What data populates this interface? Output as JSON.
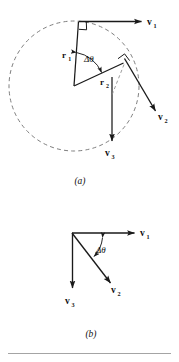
{
  "figure": {
    "background_color": "#ffffff",
    "ink_color": "#1a1a1a",
    "dash_color": "#6f6f6f",
    "panels": [
      {
        "id": "a",
        "caption": "(a)",
        "description": "Particle moving on a dashed circular path; position vectors r1 and r2 separated by angle delta-theta, with tangential velocity vectors v1 and v2, and the change vector v3.",
        "labels": {
          "r1": "r",
          "r1_sub": "1",
          "r2": "r",
          "r2_sub": "2",
          "v1": "v",
          "v1_sub": "1",
          "v2": "v",
          "v2_sub": "2",
          "v3": "v",
          "v3_sub": "3",
          "angle": "Δθ"
        },
        "elements": [
          "dashed-circle",
          "radius-r1",
          "radius-r2",
          "angle-arc",
          "right-angle-marker-top",
          "right-angle-marker-r2",
          "vector-v1",
          "vector-v2",
          "vector-v3",
          "dashed-construction-line"
        ]
      },
      {
        "id": "b",
        "caption": "(b)",
        "description": "Vector triangle: v1 horizontal to the right, v2 directed down and to the right, v3 vertical downward, with delta-theta between v1 and v2.",
        "labels": {
          "v1": "v",
          "v1_sub": "1",
          "v2": "v",
          "v2_sub": "2",
          "v3": "v",
          "v3_sub": "3",
          "angle": "Δθ"
        },
        "elements": [
          "vector-v1",
          "vector-v2",
          "vector-v3",
          "angle-arc"
        ]
      }
    ],
    "footer_rule": true
  }
}
